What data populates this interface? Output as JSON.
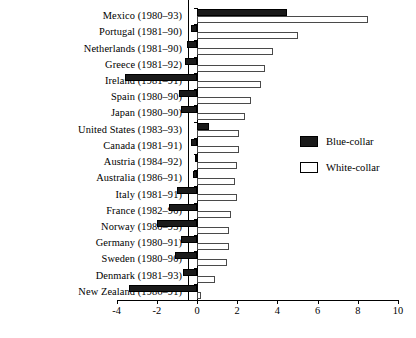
{
  "chart_data": {
    "type": "bar",
    "orientation": "horizontal",
    "title": "",
    "xlabel": "",
    "ylabel": "",
    "xlim": [
      -4,
      10
    ],
    "xticks": [
      -4,
      -2,
      0,
      2,
      4,
      6,
      8,
      10
    ],
    "xticklabels": [
      "-4",
      "-2",
      "0",
      "2",
      "4",
      "6",
      "8",
      "10"
    ],
    "grid": false,
    "legend_position": "center right",
    "categories": [
      "Mexico (1980–93)",
      "Portugal (1981–90)",
      "Netherlands (1981–90)",
      "Greece (1981–92)",
      "Ireland (1981–91)",
      "Spain (1980–90)",
      "Japan (1980–90)",
      "United States (1983–93)",
      "Canada (1981–91)",
      "Austria (1984–92)",
      "Australia (1986–91)",
      "Italy (1981–91)",
      "France (1982–90)",
      "Norway (1980–93)",
      "Germany (1980–91)",
      "Sweden (1980–90)",
      "Denmark (1981–93)",
      "New Zealand (1986–91)"
    ],
    "series": [
      {
        "name": "Blue-collar",
        "color": "#1a1a1a",
        "values": [
          4.5,
          -0.3,
          -0.5,
          -0.6,
          -3.6,
          -0.9,
          -0.8,
          0.6,
          -0.3,
          -0.1,
          -0.2,
          -1.0,
          -1.4,
          -2.0,
          -0.8,
          -1.1,
          -0.7,
          -3.4
        ]
      },
      {
        "name": "White-collar",
        "color": "#ffffff",
        "values": [
          8.5,
          5.0,
          3.8,
          3.4,
          3.2,
          2.7,
          2.4,
          2.1,
          2.1,
          2.0,
          1.9,
          2.0,
          1.7,
          1.6,
          1.6,
          1.5,
          0.9,
          0.2
        ]
      }
    ]
  },
  "legend": {
    "items": [
      {
        "label": "Blue-collar",
        "style": "blue"
      },
      {
        "label": "White-collar",
        "style": "white"
      }
    ]
  }
}
